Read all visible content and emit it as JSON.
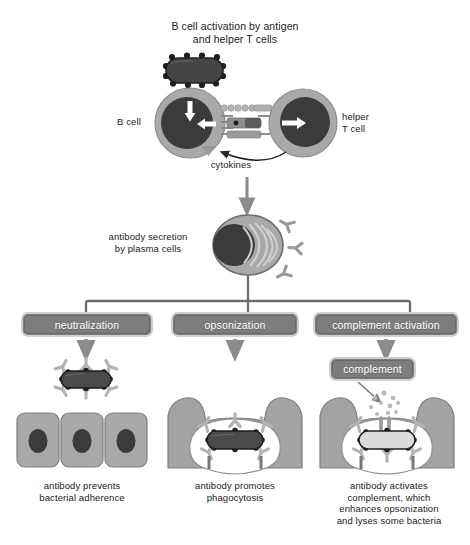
{
  "figure": {
    "title": "B cell activation by antigen\nand helper T cells",
    "palette": {
      "cell_cytoplasm": "#a8a8a8",
      "cell_nucleus": "#3a3a3a",
      "bacterium_fill": "#4a4a4a",
      "antibody": "#b0b0b0",
      "box_fill": "#7d7d7d",
      "box_border": "#c9c9c9",
      "epithelium": "#a8a8a8",
      "phagocyte": "#a0a0a0",
      "arrow": "#8f8f8f",
      "outline": "#2a2a2a",
      "text_dark": "#1b1b1b",
      "text_light": "#ffffff",
      "background": "#ffffff"
    }
  },
  "stage1": {
    "b_cell_label": "B cell",
    "t_cell_label": "helper\nT cell",
    "cytokines_label": "cytokines",
    "antigen_name": "bacterium-antigen"
  },
  "stage2": {
    "plasma_label": "antibody secretion\nby plasma cells"
  },
  "branches": [
    {
      "id": "neutralization",
      "box_label": "neutralization",
      "caption": "antibody prevents\nbacterial adherence"
    },
    {
      "id": "opsonization",
      "box_label": "opsonization",
      "caption": "antibody promotes\nphagocytosis"
    },
    {
      "id": "complement-activation",
      "box_label": "complement activation",
      "caption": "antibody activates\ncomplement, which\nenhances opsonization\nand lyses some bacteria"
    }
  ],
  "complement_box": {
    "label": "complement"
  }
}
